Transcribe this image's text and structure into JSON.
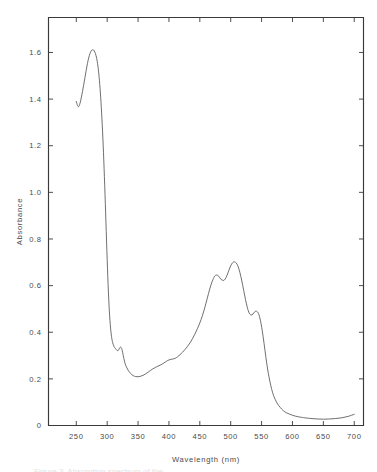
{
  "figure": {
    "background_color": "#ffffff",
    "line_color": "#55555a",
    "axis_color": "#3a3a3a",
    "text_color": "#4a4a4a",
    "caption_partial": "Figure 3. Absorption spectrum of the"
  },
  "chart_data": {
    "type": "line",
    "title": "",
    "xlabel": "Wavelength (nm)",
    "ylabel": "Absorbance",
    "xlim": [
      205,
      715
    ],
    "ylim": [
      0,
      1.75
    ],
    "xticks": [
      250,
      300,
      350,
      400,
      450,
      500,
      550,
      600,
      650,
      700
    ],
    "xtick_labels": [
      "250",
      "300",
      "350",
      "400",
      "450",
      "500",
      "550",
      "600",
      "650",
      "700"
    ],
    "yticks": [
      0,
      0.2,
      0.4,
      0.6,
      0.8,
      1.0,
      1.2,
      1.4,
      1.6
    ],
    "ytick_labels": [
      "0",
      "0.2",
      "0.4",
      "0.6",
      "0.8",
      "1.0",
      "1.2",
      "1.4",
      "1.6"
    ],
    "grid": false,
    "legend": false,
    "series": [
      {
        "name": "absorbance",
        "x": [
          250,
          252,
          254,
          256,
          258,
          260,
          262,
          264,
          266,
          268,
          270,
          272,
          274,
          276,
          278,
          280,
          282,
          284,
          286,
          288,
          290,
          292,
          294,
          296,
          298,
          300,
          302,
          304,
          306,
          308,
          310,
          312,
          314,
          316,
          318,
          320,
          322,
          324,
          326,
          328,
          330,
          334,
          338,
          342,
          346,
          350,
          354,
          358,
          362,
          366,
          370,
          374,
          378,
          382,
          386,
          390,
          394,
          398,
          402,
          406,
          410,
          414,
          418,
          422,
          426,
          430,
          434,
          438,
          442,
          446,
          450,
          454,
          458,
          462,
          466,
          470,
          474,
          477,
          480,
          484,
          488,
          491,
          494,
          497,
          500,
          503,
          506,
          509,
          512,
          515,
          518,
          521,
          524,
          527,
          530,
          533,
          536,
          539,
          542,
          545,
          548,
          551,
          554,
          557,
          560,
          564,
          568,
          572,
          576,
          580,
          585,
          590,
          595,
          600,
          605,
          610,
          615,
          620,
          630,
          640,
          650,
          660,
          670,
          680,
          690,
          700
        ],
        "y": [
          1.39,
          1.372,
          1.368,
          1.382,
          1.405,
          1.432,
          1.462,
          1.492,
          1.523,
          1.552,
          1.576,
          1.594,
          1.606,
          1.611,
          1.61,
          1.602,
          1.586,
          1.56,
          1.52,
          1.462,
          1.386,
          1.29,
          1.172,
          1.03,
          0.872,
          0.712,
          0.572,
          0.47,
          0.404,
          0.366,
          0.346,
          0.335,
          0.328,
          0.322,
          0.322,
          0.332,
          0.336,
          0.326,
          0.3,
          0.276,
          0.258,
          0.237,
          0.223,
          0.214,
          0.21,
          0.209,
          0.211,
          0.215,
          0.221,
          0.228,
          0.236,
          0.243,
          0.249,
          0.254,
          0.259,
          0.265,
          0.272,
          0.279,
          0.283,
          0.285,
          0.288,
          0.295,
          0.304,
          0.314,
          0.326,
          0.339,
          0.354,
          0.372,
          0.392,
          0.415,
          0.44,
          0.47,
          0.505,
          0.545,
          0.585,
          0.618,
          0.64,
          0.645,
          0.642,
          0.628,
          0.622,
          0.628,
          0.644,
          0.665,
          0.685,
          0.698,
          0.702,
          0.697,
          0.682,
          0.655,
          0.62,
          0.58,
          0.54,
          0.505,
          0.482,
          0.474,
          0.478,
          0.488,
          0.49,
          0.48,
          0.452,
          0.408,
          0.352,
          0.292,
          0.238,
          0.182,
          0.14,
          0.112,
          0.092,
          0.078,
          0.064,
          0.055,
          0.049,
          0.044,
          0.04,
          0.037,
          0.035,
          0.033,
          0.03,
          0.028,
          0.027,
          0.028,
          0.03,
          0.033,
          0.039,
          0.048
        ]
      }
    ],
    "annotations": {
      "peaks": [
        {
          "wavelength": 278,
          "absorbance": 1.61,
          "label": "UV maximum"
        },
        {
          "wavelength": 320,
          "absorbance": 0.336,
          "label": "shoulder"
        },
        {
          "wavelength": 477,
          "absorbance": 0.645,
          "label": "first visible peak"
        },
        {
          "wavelength": 506,
          "absorbance": 0.702,
          "label": "visible maximum"
        },
        {
          "wavelength": 542,
          "absorbance": 0.49,
          "label": "third visible peak"
        }
      ],
      "minima": [
        {
          "wavelength": 350,
          "absorbance": 0.209,
          "label": "minimum"
        },
        {
          "wavelength": 650,
          "absorbance": 0.027,
          "label": "baseline"
        }
      ]
    }
  }
}
